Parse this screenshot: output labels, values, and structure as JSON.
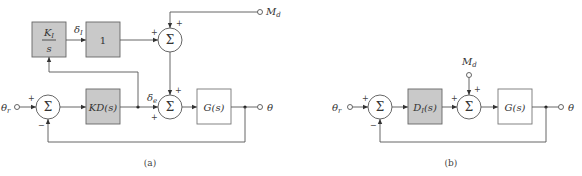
{
  "diagram_a": {
    "caption": "(a)",
    "blocks": {
      "integrator_num": "K",
      "integrator_num_sub": "I",
      "integrator_den": "s",
      "unity": "1",
      "controller": "KD(s)",
      "plant": "G(s)"
    },
    "signals": {
      "reference": "θ",
      "reference_sub": "r",
      "output": "θ",
      "disturbance": "M",
      "disturbance_sub": "d",
      "delta_i": "δ",
      "delta_i_sub": "I",
      "delta_e": "δ",
      "delta_e_sub": "e"
    },
    "sum_symbol": "Σ",
    "signs": {
      "sum1_in": "+",
      "sum1_fb": "−",
      "sum_top_left": "+",
      "sum_top_top": "+",
      "sum_bottom_left": "+",
      "sum_bottom_top": "+"
    }
  },
  "diagram_b": {
    "caption": "(b)",
    "blocks": {
      "controller": "D",
      "controller_sub": "I",
      "controller_arg": "(s)",
      "plant": "G(s)"
    },
    "signals": {
      "reference": "θ",
      "reference_sub": "r",
      "output": "θ",
      "disturbance": "M",
      "disturbance_sub": "d"
    },
    "sum_symbol": "Σ",
    "signs": {
      "sum1_in": "+",
      "sum1_fb": "−",
      "sum2_left": "+",
      "sum2_top": "+"
    }
  }
}
